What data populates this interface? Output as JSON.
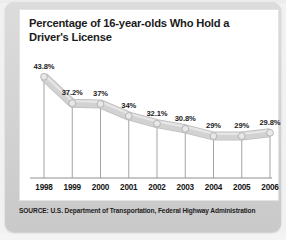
{
  "card": {
    "title": "Percentage of 16-year-olds Who Hold a Driver's License",
    "source": "SOURCE: U.S. Department of Transportation, Federal Highway Administration"
  },
  "colors": {
    "card_background": "#d6d6d6",
    "panel_background": "#ffffff",
    "ribbon": "#d2d2d2",
    "ribbon_edge": "#bdbdbd",
    "marker": "#e8e8e8",
    "marker_edge": "#a8a8a8",
    "dropline": "#9a9a9a",
    "axis": "#8f8f8f",
    "text": "#1b1b1b"
  },
  "chart_data": {
    "type": "line",
    "title": "Percentage of 16-year-olds Who Hold a Driver's License",
    "xlabel": "",
    "ylabel": "",
    "categories": [
      "1998",
      "1999",
      "2000",
      "2001",
      "2002",
      "2003",
      "2004",
      "2005",
      "2006"
    ],
    "values": [
      43.8,
      37.2,
      37.0,
      34.0,
      32.1,
      30.8,
      29.0,
      29.0,
      29.8
    ],
    "data_labels": [
      "43.8%",
      "37.2%",
      "37%",
      "34%",
      "32.1%",
      "30.8%",
      "29%",
      "29%",
      "29.8%"
    ],
    "ylim": [
      0,
      50
    ],
    "grid": false,
    "legend": null,
    "series": [
      {
        "name": "Percentage of 16-year-olds Who Hold a Driver's License",
        "values": [
          43.8,
          37.2,
          37.0,
          34.0,
          32.1,
          30.8,
          29.0,
          29.0,
          29.8
        ]
      }
    ],
    "annotations": [],
    "source": "SOURCE: U.S. Department of Transportation, Federal Highway Administration"
  }
}
